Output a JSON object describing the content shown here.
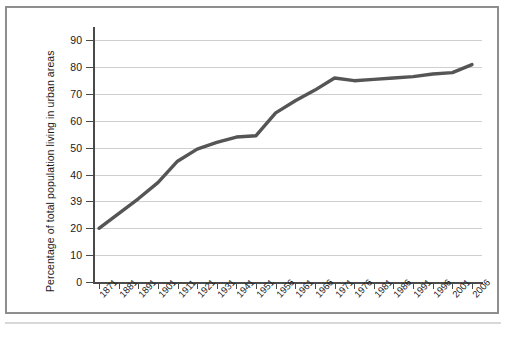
{
  "chart_data": {
    "type": "line",
    "title": "",
    "subtitle": "",
    "xlabel": "",
    "ylabel": "Percentage of total population living in urban areas",
    "ylim": [
      0,
      95
    ],
    "grid": true,
    "legend": null,
    "line_color": "#555555",
    "gridline_color": "#cfcfcf",
    "axis_color": "#4a4a4a",
    "frame_color": "#8e8e8e",
    "background_color": "#ffffff",
    "y_ticks": [
      "0",
      "10",
      "20",
      "39",
      "40",
      "50",
      "60",
      "70",
      "80",
      "90"
    ],
    "y_tick_values": [
      0,
      10,
      20,
      30,
      40,
      50,
      60,
      70,
      80,
      90
    ],
    "categories": [
      "1871",
      "1881",
      "1891",
      "1901",
      "1911",
      "1921",
      "1931",
      "1941",
      "1951",
      "1956",
      "1961",
      "1966",
      "1971",
      "1976",
      "1981",
      "1986",
      "1991",
      "1996",
      "2001",
      "2006"
    ],
    "values": [
      20,
      25.5,
      31,
      37,
      45,
      49.5,
      52,
      54,
      54.5,
      63,
      67.5,
      71.5,
      76,
      75,
      75.5,
      76,
      76.5,
      77.5,
      78,
      81
    ]
  },
  "axes": {
    "y_title": "Percentage of total population living in urban areas"
  }
}
